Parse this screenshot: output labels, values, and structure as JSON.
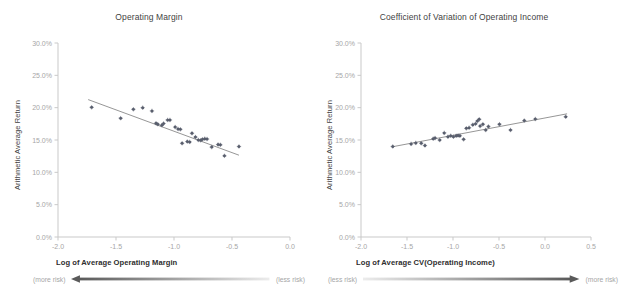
{
  "figure": {
    "background": "#ffffff",
    "point_color": "#5a5f6e",
    "line_color": "#7b7b7b",
    "axis_color": "#c9c9c9",
    "tick_text_color": "#a6a6a6",
    "arrow_dark": "#5a5a5a",
    "arrow_light": "#e8e8e8"
  },
  "panels": [
    {
      "id": "operating-margin",
      "title": "Operating Margin",
      "ylabel": "Arithmetic Average Return",
      "xlabel": "Log of Average Operating Margin",
      "risk_left_label": "(more risk)",
      "risk_right_label": "(less risk)",
      "arrow_direction": "left",
      "yticks": [
        "0.0%",
        "5.0%",
        "10.0%",
        "15.0%",
        "20.0%",
        "25.0%",
        "30.0%"
      ],
      "xticks": [
        "-2.0",
        "-1.5",
        "-1.0",
        "-0.5",
        "0.0"
      ],
      "chart_data": {
        "type": "scatter",
        "title": "Operating Margin",
        "xlabel": "Log of Average Operating Margin",
        "ylabel": "Arithmetic Average Return",
        "xlim": [
          -2.0,
          0.0
        ],
        "ylim": [
          0.0,
          0.3
        ],
        "xticks": [
          -2.0,
          -1.5,
          -1.0,
          -0.5,
          0.0
        ],
        "yticks": [
          0.0,
          0.05,
          0.1,
          0.15,
          0.2,
          0.25,
          0.3
        ],
        "grid": false,
        "legend": "none",
        "correlation": "negative",
        "trendline": {
          "type": "linear",
          "x": [
            -1.74,
            -0.44
          ],
          "y": [
            0.2125,
            0.1265
          ]
        },
        "points": [
          [
            -1.71,
            0.2005
          ],
          [
            -1.46,
            0.1838
          ],
          [
            -1.35,
            0.1975
          ],
          [
            -1.27,
            0.2
          ],
          [
            -1.19,
            0.195
          ],
          [
            -1.155,
            0.176
          ],
          [
            -1.14,
            0.1745
          ],
          [
            -1.105,
            0.173
          ],
          [
            -1.09,
            0.1755
          ],
          [
            -1.055,
            0.181
          ],
          [
            -1.035,
            0.181
          ],
          [
            -0.99,
            0.17
          ],
          [
            -0.965,
            0.167
          ],
          [
            -0.945,
            0.1665
          ],
          [
            -0.93,
            0.145
          ],
          [
            -0.885,
            0.1475
          ],
          [
            -0.865,
            0.147
          ],
          [
            -0.845,
            0.1605
          ],
          [
            -0.815,
            0.1545
          ],
          [
            -0.79,
            0.15
          ],
          [
            -0.77,
            0.1495
          ],
          [
            -0.755,
            0.151
          ],
          [
            -0.735,
            0.152
          ],
          [
            -0.715,
            0.1515
          ],
          [
            -0.675,
            0.139
          ],
          [
            -0.62,
            0.143
          ],
          [
            -0.6,
            0.1425
          ],
          [
            -0.565,
            0.1255
          ],
          [
            -0.44,
            0.14
          ]
        ]
      }
    },
    {
      "id": "cv-operating-income",
      "title": "Coefficient of Variation of Operating Income",
      "ylabel": "Arithmetic Average Return",
      "xlabel": "Log of Average CV(Operating Income)",
      "risk_left_label": "(less risk)",
      "risk_right_label": "(more risk)",
      "arrow_direction": "right",
      "yticks": [
        "0.0%",
        "5.0%",
        "10.0%",
        "15.0%",
        "20.0%",
        "25.0%",
        "30.0%"
      ],
      "xticks": [
        "-2.0",
        "-1.5",
        "-1.0",
        "-0.5",
        "0.0",
        "0.5"
      ],
      "chart_data": {
        "type": "scatter",
        "title": "Coefficient of Variation of Operating Income",
        "xlabel": "Log of Average CV(Operating Income)",
        "ylabel": "Arithmetic Average Return",
        "xlim": [
          -2.0,
          0.5
        ],
        "ylim": [
          0.0,
          0.3
        ],
        "xticks": [
          -2.0,
          -1.5,
          -1.0,
          -0.5,
          0.0,
          0.5
        ],
        "yticks": [
          0.0,
          0.05,
          0.1,
          0.15,
          0.2,
          0.25,
          0.3
        ],
        "grid": false,
        "legend": "none",
        "correlation": "positive",
        "trendline": {
          "type": "linear",
          "x": [
            -1.66,
            0.24
          ],
          "y": [
            0.1395,
            0.1905
          ]
        },
        "points": [
          [
            -1.655,
            0.14
          ],
          [
            -1.455,
            0.144
          ],
          [
            -1.405,
            0.1455
          ],
          [
            -1.345,
            0.145
          ],
          [
            -1.305,
            0.1415
          ],
          [
            -1.215,
            0.152
          ],
          [
            -1.195,
            0.153
          ],
          [
            -1.145,
            0.15
          ],
          [
            -1.095,
            0.161
          ],
          [
            -1.055,
            0.155
          ],
          [
            -1.025,
            0.1565
          ],
          [
            -0.995,
            0.155
          ],
          [
            -0.965,
            0.1565
          ],
          [
            -0.945,
            0.157
          ],
          [
            -0.925,
            0.1565
          ],
          [
            -0.885,
            0.151
          ],
          [
            -0.855,
            0.168
          ],
          [
            -0.825,
            0.169
          ],
          [
            -0.785,
            0.1735
          ],
          [
            -0.755,
            0.175
          ],
          [
            -0.735,
            0.1795
          ],
          [
            -0.715,
            0.182
          ],
          [
            -0.705,
            0.1715
          ],
          [
            -0.675,
            0.1745
          ],
          [
            -0.645,
            0.1655
          ],
          [
            -0.615,
            0.171
          ],
          [
            -0.495,
            0.1745
          ],
          [
            -0.375,
            0.1655
          ],
          [
            -0.225,
            0.18
          ],
          [
            -0.105,
            0.1825
          ],
          [
            0.225,
            0.186
          ]
        ]
      }
    }
  ]
}
